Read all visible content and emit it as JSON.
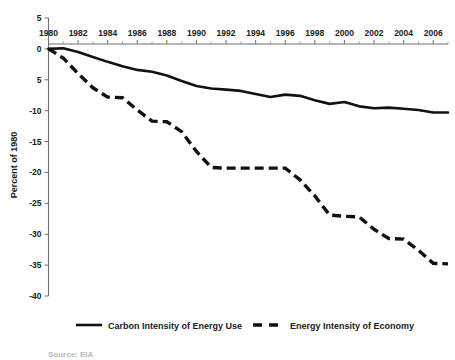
{
  "chart_data": {
    "type": "line",
    "title": "",
    "subtitle": "",
    "xlabel": "",
    "ylabel": "Percent of 1980",
    "xlim": [
      1980,
      2007
    ],
    "ylim": [
      -40,
      5
    ],
    "grid": false,
    "legend_position": "bottom",
    "x_tick_labels": [
      "1980",
      "1982",
      "1984",
      "1986",
      "1988",
      "1990",
      "1992",
      "1994",
      "1996",
      "1998",
      "2000",
      "2002",
      "2004",
      "2006"
    ],
    "x_tick_values": [
      1980,
      1982,
      1984,
      1986,
      1988,
      1990,
      1992,
      1994,
      1996,
      1998,
      2000,
      2002,
      2004,
      2006
    ],
    "x_minor_tick_values": [
      1981,
      1983,
      1985,
      1987,
      1989,
      1991,
      1993,
      1995,
      1997,
      1999,
      2001,
      2003,
      2005,
      2007
    ],
    "y_tick_labels": [
      "5",
      "0",
      "5",
      "-10",
      "-15",
      "-20",
      "-25",
      "-30",
      "-35",
      "-40"
    ],
    "y_tick_values": [
      5,
      0,
      -5,
      -10,
      -15,
      -20,
      -25,
      -30,
      -35,
      -40
    ],
    "x": [
      1980,
      1981,
      1982,
      1983,
      1984,
      1985,
      1986,
      1987,
      1988,
      1989,
      1990,
      1991,
      1992,
      1993,
      1994,
      1995,
      1996,
      1997,
      1998,
      1999,
      2000,
      2001,
      2002,
      2003,
      2004,
      2005,
      2006,
      2007
    ],
    "series": [
      {
        "name": "Carbon Intensity of Energy Use",
        "style": "solid",
        "color": "#111111",
        "values": [
          0.0,
          0.1,
          -0.5,
          -1.3,
          -2.1,
          -2.8,
          -3.4,
          -3.7,
          -4.3,
          -5.2,
          -6.0,
          -6.4,
          -6.6,
          -6.8,
          -7.3,
          -7.8,
          -7.4,
          -7.6,
          -8.3,
          -8.9,
          -8.6,
          -9.3,
          -9.6,
          -9.5,
          -9.7,
          -9.9,
          -10.3,
          -10.3
        ]
      },
      {
        "name": "Energy Intensity of Economy",
        "style": "dashed",
        "color": "#111111",
        "values": [
          0.0,
          -1.5,
          -4.0,
          -6.3,
          -7.8,
          -7.9,
          -9.9,
          -11.7,
          -11.8,
          -13.4,
          -16.6,
          -19.2,
          -19.3,
          -19.3,
          -19.3,
          -19.3,
          -19.3,
          -21.2,
          -23.8,
          -26.9,
          -27.1,
          -27.2,
          -29.2,
          -30.7,
          -30.8,
          -32.6,
          -34.7,
          -34.8
        ]
      }
    ]
  },
  "legend": {
    "items": [
      {
        "label": "Carbon Intensity of Energy Use",
        "style": "solid"
      },
      {
        "label": "Energy Intensity of Economy",
        "style": "dashed"
      }
    ]
  },
  "source": {
    "text": "Source: EIA"
  }
}
